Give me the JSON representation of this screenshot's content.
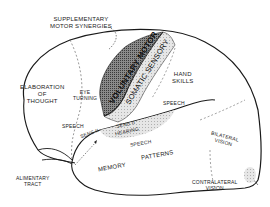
{
  "diagram": {
    "type": "brain-lateral-view-functional-areas",
    "labels": {
      "supplementary": [
        "SUPPLEMENTARY",
        "MOTOR SYNERGIES"
      ],
      "elaboration": [
        "ELABORATION",
        "OF",
        "THOUGHT"
      ],
      "eye_turning": [
        "EYE",
        "TURNING"
      ],
      "voluntary_motor": "VOLUNTARY MOTOR",
      "somatic_sensory": "SOMATIC SENSORY",
      "hand_skills": [
        "HAND",
        "SKILLS"
      ],
      "speech_frontal": "SPEECH",
      "speech_parietal": "SPEECH",
      "speech_temporal": "SPEECH",
      "sens_ii_upper": "SENS II",
      "sens_ii_lower": "SENS II",
      "hearing": "HEARING",
      "memory_patterns": [
        "MEMORY",
        "PATTERNS"
      ],
      "bilateral_vision": [
        "BILATERAL",
        "VISION"
      ],
      "contralateral_vision": [
        "CONTRALATERAL",
        "VISION"
      ],
      "alimentary_tract": [
        "ALIMENTARY",
        "TRACT"
      ]
    },
    "colors": {
      "outline": "#1a1a1a",
      "motor_strip": "#6a6a6a",
      "sensory_strip": "#cfcfcf",
      "hearing_area": "#d8d8d8",
      "text": "#222222"
    }
  }
}
